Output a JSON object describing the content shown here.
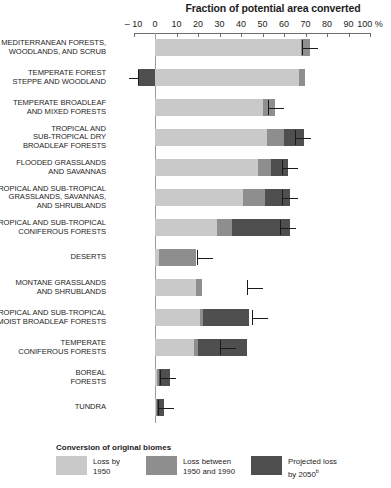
{
  "chart_data": {
    "type": "bar",
    "orientation": "horizontal",
    "stacked": true,
    "title": "Fraction of potential area converted",
    "xlabel": "",
    "ylabel": "",
    "xlim": [
      -10,
      100
    ],
    "xunit": "%",
    "xticks": [
      -10,
      0,
      10,
      20,
      30,
      40,
      50,
      60,
      70,
      80,
      90,
      100
    ],
    "xticklabels": [
      "– 10",
      "0",
      "10",
      "20",
      "30",
      "40",
      "50",
      "60",
      "70",
      "80",
      "90",
      "100 %"
    ],
    "grid": false,
    "legend_position": "bottom",
    "legend_title": "Conversion of original biomes",
    "series": [
      {
        "name": "Loss by 1950",
        "color": "#c9c9c9",
        "values": [
          68.0,
          67.0,
          50.0,
          52.0,
          48.0,
          41.0,
          29.0,
          2.0,
          19.0,
          21.0,
          18.0,
          1.0,
          0.5
        ]
      },
      {
        "name": "Loss between 1950 and 1990",
        "color": "#8e8e8e",
        "values": [
          4.0,
          3.0,
          6.0,
          8.0,
          6.0,
          10.0,
          7.0,
          17.0,
          3.0,
          1.5,
          2.0,
          1.0,
          0.5
        ]
      },
      {
        "name": "Projected loss by 2050",
        "color": "#4f4f4f",
        "values": [
          0.0,
          0.0,
          0.0,
          9.5,
          8.0,
          12.0,
          27.0,
          0.0,
          0.0,
          21.0,
          23.0,
          5.0,
          3.0
        ]
      }
    ],
    "categories": [
      "MEDITERRANEAN FORESTS, WOODLANDS, AND SCRUB",
      "TEMPERATE FOREST STEPPE AND WOODLAND",
      "TEMPERATE BROADLEAF AND MIXED FORESTS",
      "TROPICAL AND SUB-TROPICAL DRY BROADLEAF FORESTS",
      "FLOODED GRASSLANDS AND SAVANNAS",
      "TROPICAL AND SUB-TROPICAL GRASSLANDS, SAVANNAS, AND SHRUBLANDS",
      "TROPICAL AND SUB-TROPICAL CONIFEROUS FORESTS",
      "DESERTS",
      "MONTANE GRASSLANDS AND SHRUBLANDS",
      "TROPICAL AND SUB-TROPICAL MOIST BROADLEAF FORESTS",
      "TEMPERATE CONIFEROUS FORESTS",
      "BOREAL FORESTS",
      "TUNDRA"
    ],
    "rows": [
      {
        "label_lines": [
          "MEDITERRANEAN FORESTS,",
          "WOODLANDS, AND SCRUB"
        ],
        "loss_1950": 68.0,
        "loss_1950_1990": 4.0,
        "projected_2050": 0.0,
        "total": 72.0,
        "marker": 68.5
      },
      {
        "label_lines": [
          "TEMPERATE FOREST",
          "STEPPE AND WOODLAND"
        ],
        "loss_1950": 67.0,
        "loss_1950_1990": 3.0,
        "projected_2050": 0.0,
        "total": 70.0,
        "marker": -8.0
      },
      {
        "label_lines": [
          "TEMPERATE BROADLEAF",
          "AND MIXED FORESTS"
        ],
        "loss_1950": 50.0,
        "loss_1950_1990": 6.0,
        "projected_2050": 0.0,
        "total": 56.0,
        "marker": 52.5
      },
      {
        "label_lines": [
          "TROPICAL AND",
          "SUB-TROPICAL DRY",
          "BROADLEAF FORESTS"
        ],
        "loss_1950": 52.0,
        "loss_1950_1990": 8.0,
        "projected_2050": 9.5,
        "total": 69.5,
        "marker": 65.0
      },
      {
        "label_lines": [
          "FLOODED GRASSLANDS",
          "AND SAVANNAS"
        ],
        "loss_1950": 48.0,
        "loss_1950_1990": 6.0,
        "projected_2050": 8.0,
        "total": 62.0,
        "marker": 59.0
      },
      {
        "label_lines": [
          "TROPICAL AND SUB-TROPICAL",
          "GRASSLANDS, SAVANNAS,",
          "AND SHRUBLANDS"
        ],
        "loss_1950": 41.0,
        "loss_1950_1990": 10.0,
        "projected_2050": 12.0,
        "total": 63.0,
        "marker": 59.0
      },
      {
        "label_lines": [
          "TROPICAL AND SUB-TROPICAL",
          "CONIFEROUS FORESTS"
        ],
        "loss_1950": 29.0,
        "loss_1950_1990": 7.0,
        "projected_2050": 27.0,
        "total": 63.0,
        "marker": 58.0
      },
      {
        "label_lines": [
          "DESERTS"
        ],
        "loss_1950": 2.0,
        "loss_1950_1990": 17.0,
        "projected_2050": 0.0,
        "total": 19.0,
        "marker": 19.5
      },
      {
        "label_lines": [
          "MONTANE GRASSLANDS",
          "AND SHRUBLANDS"
        ],
        "loss_1950": 19.0,
        "loss_1950_1990": 3.0,
        "projected_2050": 0.0,
        "total": 42.0,
        "marker": 43.0
      },
      {
        "label_lines": [
          "TROPICAL AND SUB-TROPICAL",
          "MOIST BROADLEAF FORESTS"
        ],
        "loss_1950": 21.0,
        "loss_1950_1990": 1.5,
        "projected_2050": 21.0,
        "total": 43.5,
        "marker": 45.0
      },
      {
        "label_lines": [
          "TEMPERATE",
          "CONIFEROUS FORESTS"
        ],
        "loss_1950": 18.0,
        "loss_1950_1990": 2.0,
        "projected_2050": 23.0,
        "total": 32.0,
        "marker": 30.0
      },
      {
        "label_lines": [
          "BOREAL",
          "FORESTS"
        ],
        "loss_1950": 1.0,
        "loss_1950_1990": 1.0,
        "projected_2050": 5.0,
        "total": 2.0,
        "marker": 2.5
      },
      {
        "label_lines": [
          "TUNDRA"
        ],
        "loss_1950": 0.5,
        "loss_1950_1990": 0.5,
        "projected_2050": 3.0,
        "total": 1.5,
        "marker": 1.5
      }
    ]
  },
  "legend": {
    "title": "Conversion of original biomes",
    "items": [
      {
        "label_line1": "Loss by",
        "label_line2": "1950",
        "sup": "",
        "color": "#c9c9c9",
        "swatch": "legend-swatch-loss-1950"
      },
      {
        "label_line1": "Loss between",
        "label_line2": "1950 and 1990",
        "sup": "",
        "color": "#8e8e8e",
        "swatch": "legend-swatch-loss-1950-1990"
      },
      {
        "label_line1": "Projected loss",
        "label_line2": "by 2050",
        "sup": "b",
        "color": "#4f4f4f",
        "swatch": "legend-swatch-projected-2050"
      }
    ]
  },
  "colors": {
    "background": "#ffffff",
    "text": "#1d1d1d",
    "axis": "#6e6e6e",
    "zero_line": "#9a9a9a",
    "marker": "#1a1a1a",
    "series_1": "#c9c9c9",
    "series_2": "#8e8e8e",
    "series_3": "#4f4f4f"
  }
}
